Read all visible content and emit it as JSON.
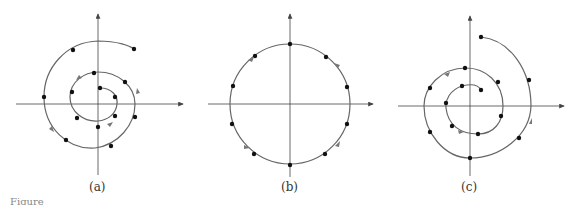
{
  "figure": {
    "panels": [
      {
        "label": "(a)",
        "description": "Spiral trajectory spiraling outward counter-clockwise with sample points"
      },
      {
        "label": "(b)",
        "description": "Circular trajectory (closed orbit) with sample points, counter-clockwise"
      },
      {
        "label": "(c)",
        "description": "Spiral trajectory spiraling outward with sample points"
      }
    ],
    "caption": "Figure"
  },
  "colors": {
    "curve": "#666666",
    "axis": "#444444",
    "point": "#111111",
    "arrow": "#777777"
  }
}
